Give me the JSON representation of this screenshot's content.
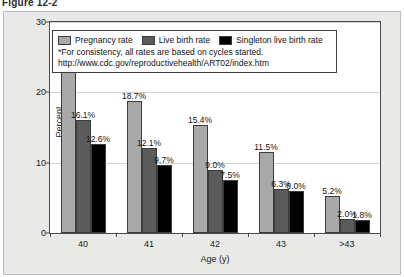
{
  "figure": {
    "title": "Figure 12-2"
  },
  "legend": {
    "entries": [
      {
        "label": "Pregnancy rate",
        "color": "#a9a9a9",
        "icon": "legend-swatch-icon"
      },
      {
        "label": "Live birth rate",
        "color": "#5b5b5b",
        "icon": "legend-swatch-icon"
      },
      {
        "label": "Singleton live birth rate",
        "color": "#000000",
        "icon": "legend-swatch-icon"
      }
    ],
    "footnote": "*For consistency, all rates are based on cycles started.",
    "url": "http://www.cdc.gov/reproductivehealth/ART02/index.htm"
  },
  "chart_data": {
    "type": "bar",
    "title": "Figure 12-2",
    "xlabel": "Age (y)",
    "ylabel": "Percent",
    "ylim": [
      0,
      30
    ],
    "yticks": [
      0,
      10,
      20,
      30
    ],
    "ytick_labels": [
      "0",
      "10",
      "20",
      "30"
    ],
    "grid": true,
    "legend_position": "top-center",
    "categories": [
      "40",
      "41",
      "42",
      "43",
      ">43"
    ],
    "series": [
      {
        "name": "Pregnancy rate",
        "color": "#a9a9a9",
        "values": [
          23.0,
          18.7,
          15.4,
          11.5,
          5.2
        ],
        "labels": [
          "23.0%",
          "18.7%",
          "15.4%",
          "11.5%",
          "5.2%"
        ]
      },
      {
        "name": "Live birth rate",
        "color": "#5b5b5b",
        "values": [
          16.1,
          12.1,
          9.0,
          6.3,
          2.0
        ],
        "labels": [
          "16.1%",
          "12.1%",
          "9.0%",
          "6.3%",
          "2.0%"
        ]
      },
      {
        "name": "Singleton live birth rate",
        "color": "#000000",
        "values": [
          12.6,
          9.7,
          7.5,
          6.0,
          1.8
        ],
        "labels": [
          "12.6%",
          "9.7%",
          "7.5%",
          "6.0%",
          "1.8%"
        ]
      }
    ]
  }
}
